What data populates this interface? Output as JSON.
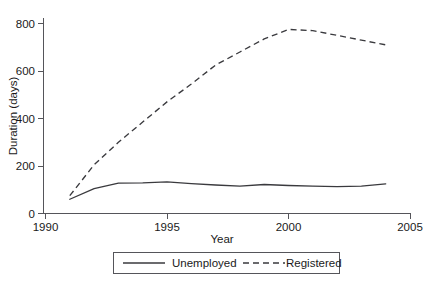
{
  "chart_data": {
    "type": "line",
    "title": "",
    "xlabel": "Year",
    "ylabel": "Duration (days)",
    "xlim": [
      1990,
      2005
    ],
    "ylim": [
      0,
      800
    ],
    "xticks": [
      1990,
      1995,
      2000,
      2005
    ],
    "xtick_labels": [
      "1990",
      "1995",
      "2000",
      "2005"
    ],
    "yticks": [
      0,
      200,
      400,
      600,
      800
    ],
    "ytick_labels": [
      "0",
      "200",
      "400",
      "600",
      "800"
    ],
    "grid": false,
    "legend_position": "below-axes",
    "line_color": "#3a3a3e",
    "axis_color": "#55555a",
    "x": [
      1991,
      1992,
      1993,
      1994,
      1995,
      1996,
      1997,
      1998,
      1999,
      2000,
      2001,
      2002,
      2003,
      2004
    ],
    "series": [
      {
        "name": "Unemployed",
        "style": "solid",
        "values": [
          60,
          105,
          128,
          129,
          133,
          126,
          120,
          115,
          122,
          118,
          115,
          113,
          115,
          125
        ]
      },
      {
        "name": "Registered",
        "style": "dashed",
        "values": [
          75,
          205,
          300,
          385,
          470,
          545,
          625,
          680,
          735,
          775,
          770,
          750,
          730,
          710
        ]
      }
    ]
  },
  "axes": {
    "x_title": "Year",
    "y_title": "Duration (days)"
  },
  "legend": {
    "entries": [
      {
        "label": "Unemployed",
        "style": "solid"
      },
      {
        "label": "Registered",
        "style": "dashed"
      }
    ]
  }
}
